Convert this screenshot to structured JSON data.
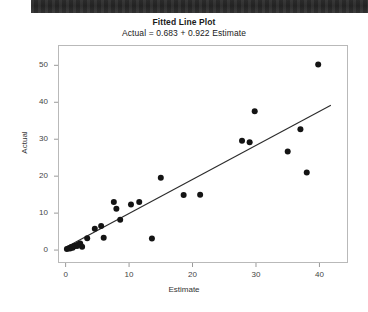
{
  "header": {
    "scan_bar": "dark-scan-artifact"
  },
  "chart_data": {
    "type": "scatter",
    "title": "Fitted Line Plot",
    "subtitle": "Actual = 0.683 + 0.922 Estimate",
    "xlabel": "Estimate",
    "ylabel": "Actual",
    "xlim": [
      -1.2,
      44.5
    ],
    "ylim": [
      -3.5,
      55.5
    ],
    "xticks": [
      0,
      10,
      20,
      30,
      40
    ],
    "yticks": [
      0,
      10,
      20,
      30,
      40,
      50
    ],
    "grid": false,
    "legend": null,
    "fit_line": {
      "intercept": 0.683,
      "slope": 0.922,
      "x_start": 0.0,
      "x_end": 41.8,
      "color": "#2b2b2b"
    },
    "marker": {
      "shape": "circle",
      "color": "#141414",
      "size": 3.0
    },
    "points": [
      {
        "x": 0.2,
        "y": 0.3
      },
      {
        "x": 0.5,
        "y": 0.5
      },
      {
        "x": 0.7,
        "y": 0.4
      },
      {
        "x": 0.9,
        "y": 0.8
      },
      {
        "x": 1.1,
        "y": 0.6
      },
      {
        "x": 1.3,
        "y": 1.0
      },
      {
        "x": 1.5,
        "y": 1.2
      },
      {
        "x": 1.8,
        "y": 1.1
      },
      {
        "x": 2.0,
        "y": 1.5
      },
      {
        "x": 2.3,
        "y": 1.8
      },
      {
        "x": 2.6,
        "y": 0.9
      },
      {
        "x": 3.4,
        "y": 3.2
      },
      {
        "x": 4.6,
        "y": 5.8
      },
      {
        "x": 5.6,
        "y": 6.5
      },
      {
        "x": 6.0,
        "y": 3.3
      },
      {
        "x": 7.6,
        "y": 13.0
      },
      {
        "x": 8.0,
        "y": 11.2
      },
      {
        "x": 8.6,
        "y": 8.2
      },
      {
        "x": 10.3,
        "y": 12.3
      },
      {
        "x": 11.6,
        "y": 13.0
      },
      {
        "x": 13.6,
        "y": 3.1
      },
      {
        "x": 15.0,
        "y": 19.6
      },
      {
        "x": 18.6,
        "y": 14.9
      },
      {
        "x": 21.2,
        "y": 15.0
      },
      {
        "x": 27.8,
        "y": 29.6
      },
      {
        "x": 29.0,
        "y": 29.2
      },
      {
        "x": 29.8,
        "y": 37.6
      },
      {
        "x": 35.0,
        "y": 26.7
      },
      {
        "x": 37.0,
        "y": 32.7
      },
      {
        "x": 38.0,
        "y": 21.0
      },
      {
        "x": 39.8,
        "y": 50.2
      }
    ]
  }
}
